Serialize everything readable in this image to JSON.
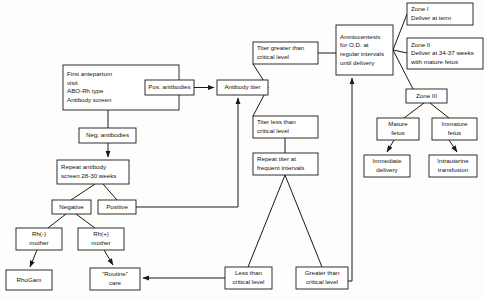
{
  "chart_data": {
    "type": "diagram",
    "nodes": [
      {
        "id": "first_visit",
        "label": [
          "First antepartum",
          "visit",
          "ABO-Rh type",
          "Antibody screen"
        ],
        "x": 63,
        "y": 65,
        "w": 116,
        "h": 45,
        "align": "left"
      },
      {
        "id": "pos_antibodies",
        "label": [
          "Pos. antibodies"
        ],
        "x": 145,
        "y": 80,
        "w": 49,
        "h": 15,
        "align": "center"
      },
      {
        "id": "antibody_titer",
        "label": [
          "Antibody titer"
        ],
        "x": 217,
        "y": 80,
        "w": 51,
        "h": 15,
        "align": "center"
      },
      {
        "id": "neg_antibodies",
        "label": [
          "Neg. antibodies"
        ],
        "x": 79,
        "y": 128,
        "w": 57,
        "h": 15,
        "align": "center"
      },
      {
        "id": "repeat_screen",
        "label": [
          "Repeat antibody",
          "screen 28-30 weeks"
        ],
        "x": 57,
        "y": 160,
        "w": 72,
        "h": 24,
        "align": "left"
      },
      {
        "id": "negative",
        "label": [
          "Negative"
        ],
        "x": 52,
        "y": 200,
        "w": 39,
        "h": 14,
        "align": "center"
      },
      {
        "id": "positive",
        "label": [
          "Positive"
        ],
        "x": 98,
        "y": 200,
        "w": 38,
        "h": 14,
        "align": "center"
      },
      {
        "id": "rh_neg_mother",
        "label": [
          "Rh(-)",
          "mother"
        ],
        "x": 16,
        "y": 228,
        "w": 46,
        "h": 22,
        "align": "center"
      },
      {
        "id": "rh_pos_mother",
        "label": [
          "Rh(+)",
          "mother"
        ],
        "x": 78,
        "y": 228,
        "w": 46,
        "h": 22,
        "align": "center"
      },
      {
        "id": "rhogam",
        "label": [
          "RhoGam"
        ],
        "x": 6,
        "y": 270,
        "w": 46,
        "h": 20,
        "align": "center"
      },
      {
        "id": "routine_care",
        "label": [
          "\"Routine\"",
          "care"
        ],
        "x": 90,
        "y": 268,
        "w": 50,
        "h": 22,
        "align": "center"
      },
      {
        "id": "titer_greater",
        "label": [
          "Titer greater than",
          "critical level"
        ],
        "x": 253,
        "y": 42,
        "w": 65,
        "h": 22,
        "align": "left"
      },
      {
        "id": "titer_less",
        "label": [
          "Titer less than",
          "critical level"
        ],
        "x": 253,
        "y": 116,
        "w": 65,
        "h": 22,
        "align": "left"
      },
      {
        "id": "repeat_titer",
        "label": [
          "Repeat titer at",
          "frequent intervals"
        ],
        "x": 253,
        "y": 153,
        "w": 65,
        "h": 22,
        "align": "left"
      },
      {
        "id": "amniocentesis",
        "label": [
          "Amniocentesis",
          "for O.D. at",
          "regular intervals",
          "until delivery"
        ],
        "x": 336,
        "y": 25,
        "w": 57,
        "h": 50,
        "align": "left"
      },
      {
        "id": "zone_i",
        "label": [
          "Zone I",
          " Deliver at term"
        ],
        "x": 407,
        "y": 3,
        "w": 66,
        "h": 22,
        "align": "left"
      },
      {
        "id": "zone_ii",
        "label": [
          "Zone II",
          "Deliver at 34-37 weeks",
          "with mature fetus"
        ],
        "x": 407,
        "y": 38,
        "w": 76,
        "h": 31,
        "align": "left"
      },
      {
        "id": "zone_iii",
        "label": [
          "Zone III"
        ],
        "x": 406,
        "y": 89,
        "w": 41,
        "h": 14,
        "align": "center"
      },
      {
        "id": "mature_fetus",
        "label": [
          "Mature",
          "fetus"
        ],
        "x": 377,
        "y": 118,
        "w": 42,
        "h": 22,
        "align": "center"
      },
      {
        "id": "immature_fetus",
        "label": [
          "Immature",
          "fetus"
        ],
        "x": 432,
        "y": 118,
        "w": 45,
        "h": 22,
        "align": "center"
      },
      {
        "id": "immediate_delivery",
        "label": [
          "Immediate",
          "delivery"
        ],
        "x": 364,
        "y": 155,
        "w": 46,
        "h": 22,
        "align": "center"
      },
      {
        "id": "intrauterine_transfusion",
        "label": [
          "Intrauterine",
          "transfusion"
        ],
        "x": 429,
        "y": 155,
        "w": 48,
        "h": 22,
        "align": "center"
      },
      {
        "id": "less_than_critical",
        "label": [
          "Less than",
          "critical level"
        ],
        "x": 225,
        "y": 267,
        "w": 47,
        "h": 22,
        "align": "center"
      },
      {
        "id": "greater_than_critical",
        "label": [
          "Greater than",
          "critical level"
        ],
        "x": 296,
        "y": 267,
        "w": 52,
        "h": 22,
        "align": "center"
      }
    ],
    "edges": [
      {
        "id": "first-to-pos",
        "from": "first_visit",
        "to": "pos_antibodies",
        "arrow": false,
        "points": "179,87.5 145,87.5"
      },
      {
        "id": "pos-to-titer",
        "from": "pos_antibodies",
        "to": "antibody_titer",
        "arrow": true,
        "points": "194,87.5 214,87.5"
      },
      {
        "id": "first-to-neg",
        "from": "first_visit",
        "to": "neg_antibodies",
        "arrow": false,
        "points": "108,110 108,128"
      },
      {
        "id": "neg-to-repeat",
        "from": "neg_antibodies",
        "to": "repeat_screen",
        "arrow": true,
        "points": "108,143 108,157"
      },
      {
        "id": "repeat-to-negative",
        "from": "repeat_screen",
        "to": "negative",
        "arrow": false,
        "points": "95,184 71,200"
      },
      {
        "id": "repeat-to-positive",
        "from": "repeat_screen",
        "to": "positive",
        "arrow": false,
        "points": "103,184 117,200"
      },
      {
        "id": "negative-to-rhneg",
        "from": "negative",
        "to": "rh_neg_mother",
        "arrow": false,
        "points": "66,214 48,228"
      },
      {
        "id": "negative-to-rhpos",
        "from": "negative",
        "to": "rh_pos_mother",
        "arrow": false,
        "points": "76,214 95,228"
      },
      {
        "id": "rhneg-to-rhogam",
        "from": "rh_neg_mother",
        "to": "rhogam",
        "arrow": true,
        "points": "37,250 30,267"
      },
      {
        "id": "rhpos-to-routine",
        "from": "rh_pos_mother",
        "to": "routine_care",
        "arrow": true,
        "points": "104,250 113,265"
      },
      {
        "id": "positive-to-titer",
        "from": "positive",
        "to": "antibody_titer",
        "arrow": true,
        "points": "136,207 238,207 238,98"
      },
      {
        "id": "titer-to-greater",
        "from": "antibody_titer",
        "to": "titer_greater",
        "arrow": false,
        "points": "268,87.5 253,64"
      },
      {
        "id": "titer-to-less",
        "from": "antibody_titer",
        "to": "titer_less",
        "arrow": false,
        "points": "268,87.5 253,116"
      },
      {
        "id": "greater-to-amnio",
        "from": "titer_greater",
        "to": "amniocentesis",
        "arrow": false,
        "points": "318,53 336,53"
      },
      {
        "id": "less-to-repeat-titer",
        "from": "titer_less",
        "to": "repeat_titer",
        "arrow": false,
        "points": "285,138 285,153"
      },
      {
        "id": "repeat-titer-to-less-crit",
        "from": "repeat_titer",
        "to": "less_than_critical",
        "arrow": false,
        "points": "285,175 248,267"
      },
      {
        "id": "repeat-titer-to-greater-crit",
        "from": "repeat_titer",
        "to": "greater_than_critical",
        "arrow": false,
        "points": "285,175 322,267"
      },
      {
        "id": "less-crit-to-routine",
        "from": "less_than_critical",
        "to": "routine_care",
        "arrow": true,
        "points": "225,278 143,278"
      },
      {
        "id": "greater-crit-to-amnio",
        "from": "greater_than_critical",
        "to": "amniocentesis",
        "arrow": true,
        "points": "348,281 352,281 352,82 352,78"
      },
      {
        "id": "amnio-to-zone1",
        "from": "amniocentesis",
        "to": "zone_i",
        "arrow": false,
        "points": "393,50 407,14"
      },
      {
        "id": "amnio-to-zone2",
        "from": "amniocentesis",
        "to": "zone_ii",
        "arrow": false,
        "points": "393,50 407,53"
      },
      {
        "id": "amnio-to-zone3",
        "from": "amniocentesis",
        "to": "zone_iii",
        "arrow": false,
        "points": "393,50 413,89"
      },
      {
        "id": "zone3-to-mature",
        "from": "zone_iii",
        "to": "mature_fetus",
        "arrow": false,
        "points": "424,103 404,118"
      },
      {
        "id": "zone3-to-immature",
        "from": "zone_iii",
        "to": "immature_fetus",
        "arrow": false,
        "points": "430,103 449,118"
      },
      {
        "id": "mature-to-immediate",
        "from": "mature_fetus",
        "to": "immediate_delivery",
        "arrow": true,
        "points": "394,140 387,152"
      },
      {
        "id": "immature-to-transfusion",
        "from": "immature_fetus",
        "to": "intrauterine_transfusion",
        "arrow": true,
        "points": "449,140 457,152"
      }
    ],
    "style": {
      "background": "#fdfdfb",
      "line_color": "#1a1a1a",
      "box_fill": "#ffffff",
      "text_color": "#111111"
    }
  }
}
